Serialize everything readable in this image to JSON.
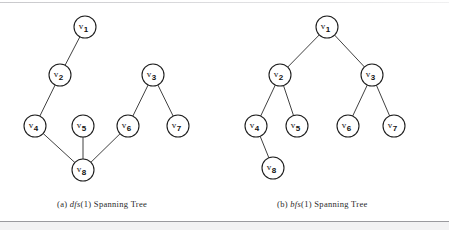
{
  "figure": {
    "background_color": "#ffffff",
    "line_color": "#2b2b2b",
    "node_fill": "#ffffff",
    "node_stroke": "#1e1e1e",
    "node_radius": 11
  },
  "panels": [
    {
      "id": "panel-a",
      "caption_prefix": "(a)",
      "caption_algorithm": "dfs",
      "caption_argument": "(1)",
      "caption_suffix": "Spanning Tree",
      "caption_full": "(a) dfs(1) Spanning Tree",
      "nodes": [
        {
          "id": "v1",
          "label": "v",
          "subscript": "1",
          "x": 85,
          "y": 27
        },
        {
          "id": "v2",
          "label": "v",
          "subscript": "2",
          "x": 60,
          "y": 75
        },
        {
          "id": "v3",
          "label": "v",
          "subscript": "3",
          "x": 153,
          "y": 75
        },
        {
          "id": "v4",
          "label": "v",
          "subscript": "4",
          "x": 35,
          "y": 126
        },
        {
          "id": "v5",
          "label": "v",
          "subscript": "5",
          "x": 83,
          "y": 126
        },
        {
          "id": "v6",
          "label": "v",
          "subscript": "6",
          "x": 128,
          "y": 126
        },
        {
          "id": "v7",
          "label": "v",
          "subscript": "7",
          "x": 178,
          "y": 126
        },
        {
          "id": "v8",
          "label": "v",
          "subscript": "8",
          "x": 83,
          "y": 170
        }
      ],
      "edges": [
        {
          "from": "v1",
          "to": "v2"
        },
        {
          "from": "v2",
          "to": "v4"
        },
        {
          "from": "v4",
          "to": "v8"
        },
        {
          "from": "v8",
          "to": "v5"
        },
        {
          "from": "v8",
          "to": "v6"
        },
        {
          "from": "v6",
          "to": "v3"
        },
        {
          "from": "v3",
          "to": "v7"
        }
      ]
    },
    {
      "id": "panel-b",
      "caption_prefix": "(b)",
      "caption_algorithm": "bfs",
      "caption_argument": "(1)",
      "caption_suffix": "Spanning Tree",
      "caption_full": "(b) bfs(1) Spanning Tree",
      "nodes": [
        {
          "id": "v1",
          "label": "v",
          "subscript": "1",
          "x": 327,
          "y": 27
        },
        {
          "id": "v2",
          "label": "v",
          "subscript": "2",
          "x": 280,
          "y": 75
        },
        {
          "id": "v3",
          "label": "v",
          "subscript": "3",
          "x": 372,
          "y": 75
        },
        {
          "id": "v4",
          "label": "v",
          "subscript": "4",
          "x": 256,
          "y": 126
        },
        {
          "id": "v5",
          "label": "v",
          "subscript": "5",
          "x": 297,
          "y": 126
        },
        {
          "id": "v6",
          "label": "v",
          "subscript": "6",
          "x": 348,
          "y": 126
        },
        {
          "id": "v7",
          "label": "v",
          "subscript": "7",
          "x": 394,
          "y": 126
        },
        {
          "id": "v8",
          "label": "v",
          "subscript": "8",
          "x": 273,
          "y": 168
        }
      ],
      "edges": [
        {
          "from": "v1",
          "to": "v2"
        },
        {
          "from": "v1",
          "to": "v3"
        },
        {
          "from": "v2",
          "to": "v4"
        },
        {
          "from": "v2",
          "to": "v5"
        },
        {
          "from": "v3",
          "to": "v6"
        },
        {
          "from": "v3",
          "to": "v7"
        },
        {
          "from": "v4",
          "to": "v8"
        }
      ]
    }
  ]
}
